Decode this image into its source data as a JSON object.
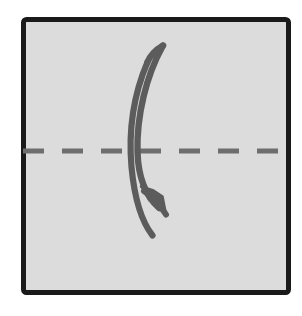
{
  "canvas": {
    "width": 302,
    "height": 316,
    "background_color": "#ffffff",
    "title": "Origami valley fold instruction"
  },
  "paper_sheet": {
    "shape": "square",
    "fill_color": "#dcdcdc",
    "border_color": "#1a1a1a",
    "border_width": 5,
    "x": 21,
    "y": 17,
    "width": 265,
    "height": 273,
    "corner_radius": 3
  },
  "fold_line": {
    "label": "horizontal fold line",
    "style": "dashed",
    "color": "#6e6e6e",
    "thickness": 5,
    "y": 151,
    "x_start": 23,
    "x_end": 285,
    "dash_length": 21,
    "gap_length": 18
  },
  "fold_arrow": {
    "label": "curved fold arrow",
    "color": "#5c5c5c",
    "direction": "downward",
    "outer_stroke": {
      "start_x": 147,
      "start_y": 62,
      "end_x": 152,
      "end_y": 235,
      "bow_x": 130,
      "width": 6
    },
    "inner_stroke": {
      "start_x": 163,
      "start_y": 45,
      "end_x": 160,
      "end_y": 200,
      "bow_x": 136,
      "width": 6
    },
    "arrow_head": {
      "tip_x": 164,
      "tip_y": 211,
      "size": 30,
      "angle_deg": 38
    }
  },
  "colors": {
    "paper": "#dcdcdc",
    "outline": "#1a1a1a",
    "fold_line": "#6e6e6e",
    "arrow": "#5c5c5c",
    "background": "#ffffff"
  }
}
